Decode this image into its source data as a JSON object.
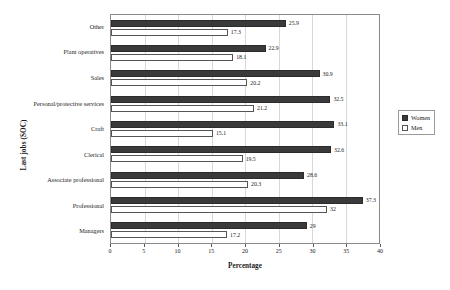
{
  "chart_data": {
    "type": "bar",
    "orientation": "horizontal",
    "title": "",
    "xlabel": "Percentage",
    "ylabel": "Last jobs (SOC)",
    "xlim": [
      0,
      40
    ],
    "xticks": [
      0,
      5,
      10,
      15,
      20,
      25,
      30,
      35,
      40
    ],
    "grid": true,
    "legend_position": "right",
    "categories": [
      "Other",
      "Plant operatives",
      "Sales",
      "Personal/protective services",
      "Craft",
      "Clerical",
      "Associate professional",
      "Professional",
      "Managers"
    ],
    "series": [
      {
        "name": "Women",
        "color": "#3a3a3a",
        "values": [
          25.9,
          22.9,
          30.9,
          32.5,
          33.1,
          32.6,
          28.6,
          37.3,
          29
        ],
        "labels": [
          "25.9",
          "22.9",
          "30.9",
          "32.5",
          "33.1",
          "32.6",
          "28.6",
          "37.3",
          "29"
        ]
      },
      {
        "name": "Men",
        "color": "#ffffff",
        "values": [
          17.3,
          18.1,
          20.2,
          21.2,
          15.1,
          19.5,
          20.3,
          32,
          17.2
        ],
        "labels": [
          "17.3",
          "18.1",
          "20.2",
          "21.2",
          "15.1",
          "19.5",
          "20.3",
          "32",
          "17.2"
        ]
      }
    ]
  }
}
